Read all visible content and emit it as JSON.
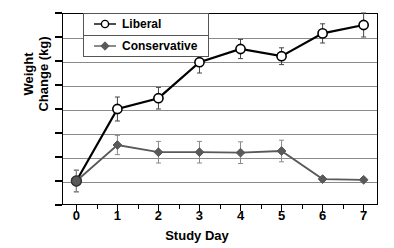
{
  "chart_data": {
    "type": "line",
    "title": "",
    "xlabel": "Study Day",
    "ylabel": "Weight Change (kg)",
    "ylabel_lines": [
      "Weight",
      "Change (kg)"
    ],
    "x": [
      0,
      1,
      2,
      3,
      4,
      5,
      6,
      7
    ],
    "xtick_labels": [
      "0",
      "1",
      "2",
      "3",
      "4",
      "5",
      "6",
      "7"
    ],
    "ytick_labels": [
      "-1",
      "0",
      "1",
      "2",
      "3",
      "4",
      "5",
      "6",
      "7"
    ],
    "yticks": [
      -1,
      0,
      1,
      2,
      3,
      4,
      5,
      6,
      7
    ],
    "xlim": [
      -0.35,
      7.35
    ],
    "ylim": [
      -1,
      7
    ],
    "grid": "horizontal",
    "legend_position": "upper-left-inside",
    "series": [
      {
        "name": "Liberal",
        "marker": "open-circle",
        "color": "#000000",
        "values": [
          0,
          3.0,
          3.45,
          4.95,
          5.5,
          5.2,
          6.15,
          6.5
        ],
        "errors": [
          0.45,
          0.5,
          0.45,
          0.45,
          0.4,
          0.35,
          0.4,
          0.5
        ]
      },
      {
        "name": "Conservative",
        "marker": "filled-diamond",
        "color": "#595959",
        "values": [
          0,
          1.5,
          1.2,
          1.2,
          1.18,
          1.25,
          0.08,
          0.05
        ],
        "errors": [
          0.45,
          0.4,
          0.45,
          0.45,
          0.45,
          0.45,
          0,
          0
        ]
      }
    ]
  }
}
